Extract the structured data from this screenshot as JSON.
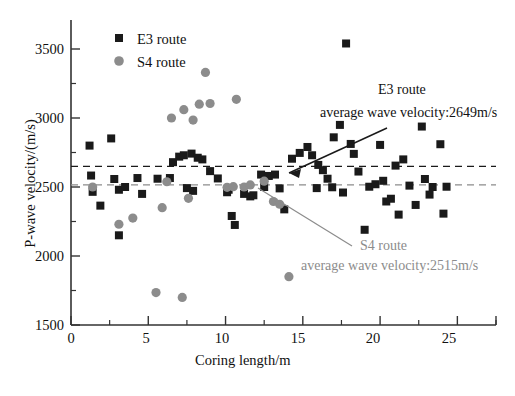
{
  "chart_data": {
    "type": "scatter",
    "title": "",
    "xlabel": "Coring length/m",
    "ylabel": "P-wave velocity/(m/s)",
    "xlim": [
      0,
      27.5
    ],
    "ylim": [
      1500,
      3700
    ],
    "xticks": [
      0,
      5,
      10,
      15,
      20,
      25
    ],
    "yticks": [
      1500,
      2000,
      2500,
      3000,
      3500
    ],
    "xtick_labels": [
      "0",
      "5",
      "10",
      "15",
      "20",
      "25"
    ],
    "ytick_labels": [
      "1500",
      "2000",
      "2500",
      "3000",
      "3500"
    ],
    "minor_ticks": true,
    "grid": false,
    "legend_position": "top-left",
    "series": [
      {
        "name": "E3 route",
        "marker": "square",
        "color": "#1a1a1a",
        "points": [
          [
            1.2,
            2800
          ],
          [
            1.3,
            2583
          ],
          [
            1.4,
            2465
          ],
          [
            1.9,
            2365
          ],
          [
            2.6,
            2852
          ],
          [
            2.8,
            2558
          ],
          [
            3.1,
            2480
          ],
          [
            3.1,
            2150
          ],
          [
            3.5,
            2500
          ],
          [
            4.3,
            2565
          ],
          [
            4.6,
            2450
          ],
          [
            5.6,
            2560
          ],
          [
            6.4,
            2565
          ],
          [
            6.6,
            2680
          ],
          [
            7.0,
            2720
          ],
          [
            7.3,
            2730
          ],
          [
            7.5,
            2492
          ],
          [
            7.8,
            2742
          ],
          [
            7.9,
            2472
          ],
          [
            8.2,
            2712
          ],
          [
            8.5,
            2700
          ],
          [
            9.0,
            2615
          ],
          [
            9.5,
            2562
          ],
          [
            10.1,
            2462
          ],
          [
            10.2,
            2480
          ],
          [
            10.4,
            2290
          ],
          [
            10.6,
            2225
          ],
          [
            11.2,
            2450
          ],
          [
            11.6,
            2432
          ],
          [
            11.8,
            2440
          ],
          [
            12.3,
            2590
          ],
          [
            12.5,
            2500
          ],
          [
            12.8,
            2580
          ],
          [
            13.2,
            2590
          ],
          [
            13.5,
            2490
          ],
          [
            13.8,
            2338
          ],
          [
            14.3,
            2705
          ],
          [
            14.8,
            2747
          ],
          [
            15.3,
            2790
          ],
          [
            15.6,
            2730
          ],
          [
            15.9,
            2492
          ],
          [
            16.0,
            2660
          ],
          [
            16.3,
            2622
          ],
          [
            16.6,
            2560
          ],
          [
            16.9,
            2498
          ],
          [
            17.0,
            2860
          ],
          [
            17.4,
            2950
          ],
          [
            17.6,
            2460
          ],
          [
            17.8,
            3540
          ],
          [
            18.1,
            2812
          ],
          [
            18.3,
            2740
          ],
          [
            18.6,
            2612
          ],
          [
            19.0,
            2190
          ],
          [
            19.3,
            2502
          ],
          [
            19.7,
            2520
          ],
          [
            20.0,
            2805
          ],
          [
            20.2,
            2545
          ],
          [
            20.4,
            2395
          ],
          [
            20.7,
            2415
          ],
          [
            21.0,
            2655
          ],
          [
            21.2,
            2300
          ],
          [
            21.5,
            2700
          ],
          [
            21.9,
            2510
          ],
          [
            22.3,
            2370
          ],
          [
            22.7,
            2938
          ],
          [
            22.9,
            2558
          ],
          [
            23.2,
            2445
          ],
          [
            23.4,
            2500
          ],
          [
            23.9,
            2810
          ],
          [
            24.1,
            2307
          ],
          [
            24.3,
            2502
          ]
        ]
      },
      {
        "name": "S4 route",
        "marker": "circle",
        "color": "#8c8c8c",
        "points": [
          [
            1.4,
            2500
          ],
          [
            3.1,
            2230
          ],
          [
            4.0,
            2275
          ],
          [
            5.5,
            1735
          ],
          [
            5.9,
            2350
          ],
          [
            6.2,
            2538
          ],
          [
            6.5,
            3000
          ],
          [
            7.2,
            1700
          ],
          [
            7.3,
            3060
          ],
          [
            7.6,
            2418
          ],
          [
            7.9,
            2985
          ],
          [
            8.3,
            3100
          ],
          [
            8.7,
            3330
          ],
          [
            9.0,
            3105
          ],
          [
            10.1,
            2498
          ],
          [
            10.5,
            2502
          ],
          [
            10.7,
            3135
          ],
          [
            11.2,
            2500
          ],
          [
            11.6,
            2515
          ],
          [
            12.5,
            2542
          ],
          [
            13.1,
            2395
          ],
          [
            13.5,
            2375
          ],
          [
            14.1,
            1850
          ]
        ]
      }
    ],
    "reference_lines": [
      {
        "name": "E3 route average",
        "value": 2649,
        "color": "#1a1a1a",
        "style": "dashed",
        "label_line1": "E3 route",
        "label_line2": "average wave velocity:2649m/s"
      },
      {
        "name": "S4 route average",
        "value": 2515,
        "color": "#8c8c8c",
        "style": "dashed",
        "label_line1": "S4 route",
        "label_line2": "average wave velocity:2515m/s"
      }
    ]
  },
  "legend": {
    "entries": [
      {
        "label": "E3 route",
        "marker": "square",
        "color": "#1a1a1a"
      },
      {
        "label": "S4 route",
        "marker": "circle",
        "color": "#8c8c8c"
      }
    ]
  },
  "axes": {
    "x_title": "Coring length/m",
    "y_title": "P-wave velocity/(m/s)",
    "x_ticks": [
      "0",
      "5",
      "10",
      "15",
      "20",
      "25"
    ],
    "y_ticks": [
      "3500",
      "3000",
      "2500",
      "2000",
      "1500"
    ]
  },
  "annotations": {
    "e3": {
      "line1": "E3 route",
      "line2": "average wave velocity:2649m/s"
    },
    "s4": {
      "line1": "S4 route",
      "line2": "average wave velocity:2515m/s"
    }
  },
  "colors": {
    "e3": "#1a1a1a",
    "s4": "#8c8c8c",
    "axis": "#333333",
    "background": "#ffffff"
  }
}
